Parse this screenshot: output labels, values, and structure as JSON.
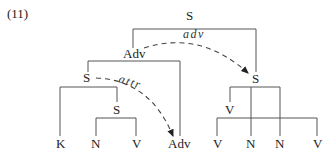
{
  "example_number": "(11)",
  "nodes": {
    "root": "S",
    "adv_phrase": "Adv",
    "left_s": "S",
    "inner_s": "S",
    "right_s": "S",
    "right_v": "V"
  },
  "leaves": {
    "k": "K",
    "n1": "N",
    "v1": "V",
    "adv": "Adv",
    "v2": "V",
    "n2": "N",
    "n3": "N",
    "v3": "V"
  },
  "arrows": {
    "adv_label": "adv",
    "attr_label": "attr"
  },
  "colors": {
    "line": "#555555",
    "text": "#222222",
    "background": "#ffffff"
  }
}
